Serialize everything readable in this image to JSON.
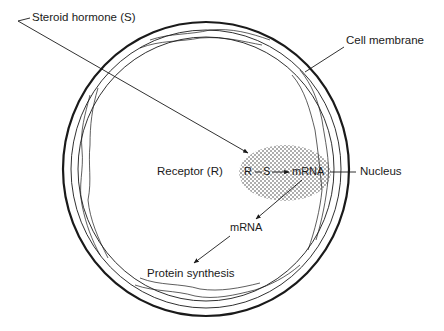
{
  "diagram": {
    "labels": {
      "steroid_hormone": "Steroid hormone (S)",
      "cell_membrane": "Cell membrane",
      "receptor": "Receptor (R)",
      "complex_r": "R",
      "complex_s": "S",
      "nuclear_mrna": "mRNA",
      "nucleus": "Nucleus",
      "cytoplasmic_mrna": "mRNA",
      "protein_synthesis": "Protein synthesis"
    },
    "flow": [
      {
        "from": "Steroid hormone (S)",
        "to": "Nucleus (R—S complex)"
      },
      {
        "from": "R—S",
        "to": "mRNA"
      },
      {
        "from": "mRNA (nucleus)",
        "to": "mRNA (cytoplasm)"
      },
      {
        "from": "mRNA (cytoplasm)",
        "to": "Protein synthesis"
      }
    ],
    "colors": {
      "line": "#1a1a1a",
      "background": "#ffffff"
    }
  }
}
